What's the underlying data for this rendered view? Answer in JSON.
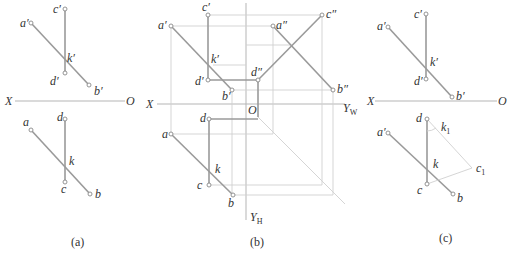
{
  "panels": {
    "a": {
      "caption": "(a)",
      "labels": {
        "a_prime": "a′",
        "c_prime": "c′",
        "k_prime": "k′",
        "d_prime": "d′",
        "b_prime": "b′",
        "X": "X",
        "O": "O",
        "a": "a",
        "d": "d",
        "k": "k",
        "c": "c",
        "b": "b"
      }
    },
    "b": {
      "caption": "(b)",
      "labels": {
        "c_prime": "c′",
        "a_prime": "a′",
        "a_dprime": "a″",
        "c_dprime": "c″",
        "k_prime": "k′",
        "d_prime": "d′",
        "d_dprime": "d″",
        "b_prime": "b′",
        "b_dprime": "b″",
        "X": "X",
        "O": "O",
        "Yw": "Y",
        "Yw_sub": "W",
        "d": "d",
        "a": "a",
        "k": "k",
        "c": "c",
        "b": "b",
        "Yh": "Y",
        "Yh_sub": "H"
      }
    },
    "c": {
      "caption": "(c)",
      "labels": {
        "c_prime": "c′",
        "a_prime": "a′",
        "k_prime": "k′",
        "d_prime": "d′",
        "b_prime": "b′",
        "X": "X",
        "O": "O",
        "d": "d",
        "k1": "k",
        "k1_sub": "1",
        "a_prime_h": "a′",
        "k": "k",
        "c1": "c",
        "c1_sub": "1",
        "c": "c",
        "b": "b"
      }
    }
  }
}
